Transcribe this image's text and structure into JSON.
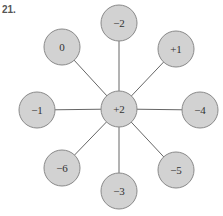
{
  "problem_number": "21.",
  "center": {
    "label": "+2",
    "x": 119,
    "y": 109
  },
  "radius": 18,
  "colors": {
    "fill": "#d2d2d2",
    "stroke": "#8a8a8a",
    "edge": "#666666",
    "text": "#333333"
  },
  "nodes": [
    {
      "label": "−2",
      "x": 119,
      "y": 23
    },
    {
      "label": "+1",
      "x": 176,
      "y": 49
    },
    {
      "label": "−4",
      "x": 200,
      "y": 110
    },
    {
      "label": "−5",
      "x": 176,
      "y": 170
    },
    {
      "label": "−3",
      "x": 119,
      "y": 191
    },
    {
      "label": "−6",
      "x": 62,
      "y": 168
    },
    {
      "label": "−1",
      "x": 37,
      "y": 110
    },
    {
      "label": "0",
      "x": 62,
      "y": 47
    }
  ]
}
